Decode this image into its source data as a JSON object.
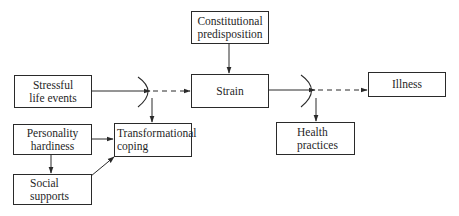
{
  "diagram": {
    "type": "flow-model",
    "nodes": {
      "constitutional": {
        "line1": "Constitutional",
        "line2": "predisposition"
      },
      "stressful": {
        "line1": "Stressful",
        "line2": "life events"
      },
      "strain": {
        "line1": "Strain"
      },
      "illness": {
        "line1": "Illness"
      },
      "hardiness": {
        "line1": "Personality",
        "line2": "hardiness"
      },
      "social": {
        "line1": "Social",
        "line2": "supports"
      },
      "coping": {
        "line1": "Transformational",
        "line2": "coping"
      },
      "health": {
        "line1": "Health",
        "line2": "practices"
      }
    },
    "edges": [
      {
        "from": "Stressful life events",
        "to": "Strain",
        "style": "solid-then-dashed",
        "moderated_by": "Transformational coping"
      },
      {
        "from": "Constitutional predisposition",
        "to": "Strain",
        "style": "solid"
      },
      {
        "from": "Strain",
        "to": "Illness",
        "style": "solid-then-dashed",
        "moderated_by": "Health practices"
      },
      {
        "from": "Personality hardiness",
        "to": "Transformational coping",
        "style": "solid"
      },
      {
        "from": "Personality hardiness",
        "to": "Social supports",
        "style": "solid"
      },
      {
        "from": "Social supports",
        "to": "Transformational coping",
        "style": "solid"
      }
    ],
    "colors": {
      "line": "#2a2a2a",
      "text": "#1f1f1f",
      "background": "#ffffff"
    }
  }
}
